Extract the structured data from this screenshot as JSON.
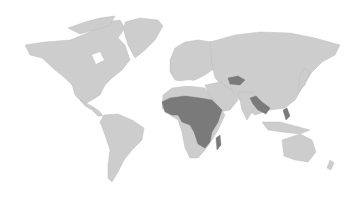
{
  "map": {
    "type": "world choropleth",
    "projection": "equirectangular-like",
    "colors": {
      "background": "#ffffff",
      "base_land": "#cdcdcd",
      "highlighted": "#7a7a7a"
    },
    "highlighted_regions": [
      "West Africa (Sahel)",
      "Central Africa",
      "East Africa",
      "Southern-east Africa (Mozambique region)",
      "Madagascar",
      "Central Asia (Afghanistan/Tajikistan area)",
      "Myanmar",
      "Laos / Cambodia",
      "Philippines"
    ]
  }
}
